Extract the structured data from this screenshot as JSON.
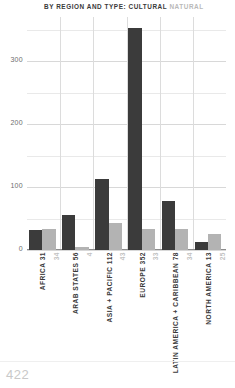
{
  "title": {
    "prefix": "BY REGION AND TYPE:",
    "legend_cultural": "CULTURAL",
    "legend_natural": "NATURAL"
  },
  "colors": {
    "cultural": "#3b3b3b",
    "natural": "#b3b3b3",
    "grid": "#d8d8d8",
    "axis_text": "#6e6e6e",
    "footer": "#c9c9c9"
  },
  "footer": {
    "page_number": "422"
  },
  "chart_data": {
    "type": "bar",
    "title": "BY REGION AND TYPE: CULTURAL NATURAL",
    "xlabel": "",
    "ylabel": "",
    "ylim": [
      0,
      370
    ],
    "yticks": [
      0,
      100,
      200,
      300
    ],
    "ytick_labels": [
      "0",
      "100",
      "200",
      "300"
    ],
    "minor_yticks": [
      50,
      150,
      250,
      350
    ],
    "grid": true,
    "legend": [
      "CULTURAL",
      "NATURAL"
    ],
    "legend_position": "title",
    "categories": [
      "AFRICA",
      "ARAB STATES",
      "ASIA + PACIFIC",
      "EUROPE",
      "LATIN AMERICA + CARIBBEAN",
      "NORTH AMERICA"
    ],
    "series": [
      {
        "name": "CULTURAL",
        "values": [
          31,
          56,
          112,
          352,
          78,
          13
        ]
      },
      {
        "name": "NATURAL",
        "values": [
          34,
          4,
          43,
          33,
          34,
          25
        ]
      }
    ]
  }
}
